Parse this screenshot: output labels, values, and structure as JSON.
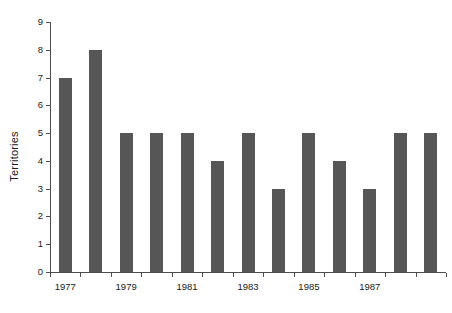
{
  "chart_data": {
    "type": "bar",
    "title": "",
    "xlabel": "",
    "ylabel": "Territories",
    "categories": [
      "1977",
      "1978",
      "1979",
      "1980",
      "1981",
      "1982",
      "1983",
      "1984",
      "1985",
      "1986",
      "1987",
      "1988",
      "1989"
    ],
    "values": [
      7,
      8,
      5,
      5,
      5,
      4,
      5,
      3,
      5,
      4,
      3,
      5,
      5
    ],
    "ylim": [
      0,
      9
    ],
    "ytick_labels": [
      "0",
      "1",
      "2",
      "3",
      "4",
      "5",
      "6",
      "7",
      "8",
      "9"
    ],
    "ytick_values": [
      0,
      1,
      2,
      3,
      4,
      5,
      6,
      7,
      8,
      9
    ],
    "xtick_labels": [
      "1977",
      "1979",
      "1981",
      "1983",
      "1985",
      "1987"
    ],
    "xtick_categories": [
      "1977",
      "1979",
      "1981",
      "1983",
      "1985",
      "1987"
    ],
    "grid": false,
    "legend": null,
    "bar_color": "#565656",
    "axis_color": "#4d4d4d",
    "text_color": "#1a1a1a",
    "background": "#ffffff"
  }
}
